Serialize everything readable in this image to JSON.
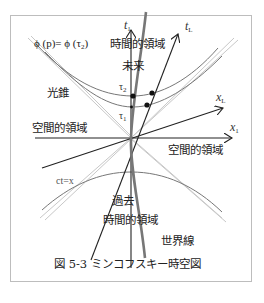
{
  "figure": {
    "caption": "図 5-3 ミンコフスキー時空図",
    "colors": {
      "frame": "#bdbdbd",
      "axis": "#222222",
      "light_cone": "#c8c8c8",
      "hyperbola": "#777777",
      "world_line": "#777777",
      "dot": "#111111"
    }
  },
  "labels": {
    "t1": "t",
    "t1_sub": "1",
    "tL": "t",
    "tL_sub": "L",
    "x1": "x",
    "x1_sub": "1",
    "xL": "x",
    "xL_sub": "L",
    "phi_eq": "ϕ (p)= ϕ (τ",
    "phi_eq_sub": "2",
    "phi_eq_close": ")",
    "tau2": "τ",
    "tau2_sub": "2",
    "tau1": "τ",
    "tau1_sub": "1",
    "light_cone": "光錐",
    "future": "未来",
    "future_timelike": "時間的領域",
    "spacelike_left": "空間的領域",
    "spacelike_right": "空間的領域",
    "ct_eq_x": "ct=x",
    "past": "過去",
    "past_timelike": "時間的領域",
    "world_line": "世界線"
  }
}
